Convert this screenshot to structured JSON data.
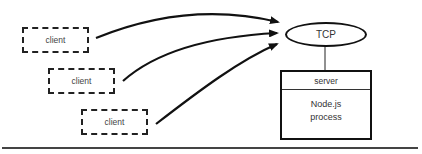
{
  "diagram": {
    "clients": [
      {
        "label": "client"
      },
      {
        "label": "client"
      },
      {
        "label": "client"
      }
    ],
    "tcp": {
      "label": "TCP"
    },
    "server": {
      "header": "server",
      "body_line1": "Node.js",
      "body_line2": "process"
    },
    "colors": {
      "stroke": "#111111",
      "text": "#333333",
      "background": "#ffffff"
    }
  }
}
